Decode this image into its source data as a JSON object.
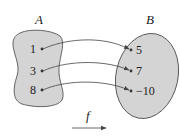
{
  "diagram": {
    "type": "function-mapping",
    "domain_set": {
      "name": "A",
      "elements": [
        "1",
        "3",
        "8"
      ]
    },
    "codomain_set": {
      "name": "B",
      "elements": [
        "5",
        "7",
        "−10"
      ]
    },
    "mappings": [
      {
        "from": "1",
        "to": "5"
      },
      {
        "from": "3",
        "to": "7"
      },
      {
        "from": "8",
        "to": "−10"
      }
    ],
    "function_label": "f",
    "colors": {
      "set_fill": "#d4d4d4",
      "set_stroke": "#555555",
      "arrow": "#444444",
      "text": "#222222"
    }
  }
}
